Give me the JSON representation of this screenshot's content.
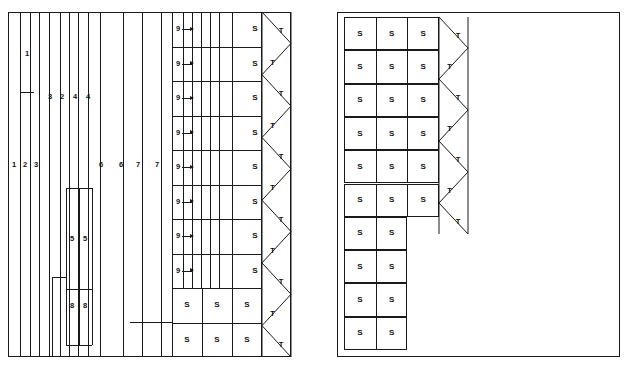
{
  "diagram": {
    "title": "",
    "background": "#ffffff",
    "stroke_color": "#1a1a1a",
    "width": 628,
    "height": 371
  },
  "left_panel": {
    "name": "left-layout-panel",
    "x": 8,
    "y": 12,
    "w": 283,
    "h": 345,
    "vertical_strips": [
      {
        "x": 8,
        "label": null
      },
      {
        "x": 20,
        "label": "1"
      },
      {
        "x": 30,
        "label": "2"
      },
      {
        "x": 39,
        "label": "3"
      },
      {
        "x": 49,
        "label": null
      },
      {
        "x": 60,
        "label": null
      },
      {
        "x": 69,
        "label": null
      },
      {
        "x": 78,
        "label": null
      },
      {
        "x": 88,
        "label": null
      },
      {
        "x": 100,
        "label": null
      },
      {
        "x": 123,
        "label": null
      },
      {
        "x": 142,
        "label": null
      },
      {
        "x": 161,
        "label": null
      }
    ],
    "upper_labels": [
      {
        "text": "1",
        "x": 27,
        "y": 54
      },
      {
        "text": "3",
        "x": 50,
        "y": 97
      },
      {
        "text": "2",
        "x": 62,
        "y": 97
      },
      {
        "text": "4",
        "x": 75,
        "y": 97
      },
      {
        "text": "4",
        "x": 88,
        "y": 97
      }
    ],
    "mid_labels": [
      {
        "text": "1",
        "x": 14,
        "y": 165
      },
      {
        "text": "2",
        "x": 25,
        "y": 165
      },
      {
        "text": "3",
        "x": 36,
        "y": 165
      },
      {
        "text": "6",
        "x": 101,
        "y": 165
      },
      {
        "text": "6",
        "x": 121,
        "y": 165
      },
      {
        "text": "7",
        "x": 138,
        "y": 165
      },
      {
        "text": "7",
        "x": 157,
        "y": 165
      }
    ],
    "lower_labels": [
      {
        "text": "5",
        "x": 72,
        "y": 239
      },
      {
        "text": "5",
        "x": 85,
        "y": 239
      },
      {
        "text": "8",
        "x": 72,
        "y": 306
      },
      {
        "text": "8",
        "x": 85,
        "y": 306
      }
    ],
    "short_rules": [
      {
        "x1": 20,
        "x2": 34,
        "y": 92
      },
      {
        "x1": 66,
        "x2": 92,
        "y": 188
      },
      {
        "x1": 52,
        "x2": 66,
        "y": 277
      },
      {
        "x1": 66,
        "x2": 92,
        "y": 289
      },
      {
        "x1": 66,
        "x2": 92,
        "y": 345
      },
      {
        "x1": 130,
        "x2": 172,
        "y": 322
      }
    ],
    "sub_columns": [
      {
        "x": 66,
        "y1": 188,
        "y2": 345
      },
      {
        "x": 79,
        "y1": 188,
        "y2": 345
      },
      {
        "x": 92,
        "y1": 188,
        "y2": 345
      },
      {
        "x": 52,
        "y1": 277,
        "y2": 357
      }
    ],
    "grid": {
      "x": 172,
      "y": 12,
      "w": 90,
      "h": 345,
      "row_count": 10,
      "inner_verticals": [
        183,
        192,
        201,
        210,
        219,
        232
      ],
      "arrow_rows": [
        {
          "label": "9",
          "cell": "S"
        },
        {
          "label": "9",
          "cell": "S"
        },
        {
          "label": "9",
          "cell": "S"
        },
        {
          "label": "9",
          "cell": "S"
        },
        {
          "label": "9",
          "cell": "S"
        },
        {
          "label": "9",
          "cell": "S"
        },
        {
          "label": "9",
          "cell": "S"
        },
        {
          "label": "9",
          "cell": "S"
        }
      ],
      "bottom_rows": [
        {
          "cells": [
            "S",
            "S",
            "S"
          ]
        },
        {
          "cells": [
            "S",
            "S",
            "S"
          ]
        }
      ]
    },
    "zigzag": {
      "x": 262,
      "y": 12,
      "w": 29,
      "h": 345,
      "triangle_count": 11,
      "label": "T",
      "labels": [
        "T",
        "T",
        "T",
        "T",
        "T",
        "T",
        "T",
        "T",
        "T",
        "T",
        "T"
      ]
    }
  },
  "right_panel": {
    "name": "right-layout-panel",
    "x": 337,
    "y": 12,
    "w": 283,
    "h": 345,
    "grid": {
      "x": 344,
      "y": 17,
      "w": 95,
      "h": 333,
      "col_width": 31.7,
      "row_height": 33.3,
      "rows": [
        {
          "cells": [
            "S",
            "S",
            "S"
          ]
        },
        {
          "cells": [
            "S",
            "S",
            "S"
          ]
        },
        {
          "cells": [
            "S",
            "S",
            "S"
          ]
        },
        {
          "cells": [
            "S",
            "S",
            "S"
          ]
        },
        {
          "cells": [
            "S",
            "S",
            "S"
          ]
        },
        {
          "cells": [
            "S",
            "S",
            "S"
          ]
        },
        {
          "cells": [
            "S",
            "S"
          ]
        },
        {
          "cells": [
            "S",
            "S"
          ]
        },
        {
          "cells": [
            "S",
            "S"
          ]
        },
        {
          "cells": [
            "S",
            "S"
          ]
        }
      ]
    },
    "zigzag": {
      "x": 439,
      "y": 17,
      "w": 29,
      "h": 217,
      "triangle_count": 7,
      "label": "T",
      "labels": [
        "T",
        "T",
        "T",
        "T",
        "T",
        "T",
        "T"
      ]
    }
  }
}
